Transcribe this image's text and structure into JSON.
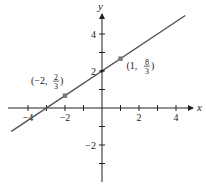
{
  "figure": {
    "type": "line-graph",
    "colors": {
      "axis": "#222222",
      "line": "#555555",
      "point": "#777777"
    },
    "axes": {
      "x_label": "x",
      "y_label": "y",
      "x_range": [
        -5,
        5
      ],
      "y_range": [
        -4,
        5.5
      ],
      "x_ticks": [
        -4,
        -3,
        -2,
        -1,
        1,
        2,
        3,
        4
      ],
      "y_ticks": [
        -3,
        -2,
        -1,
        1,
        2,
        3,
        4
      ],
      "x_tick_labels": [
        {
          "value": -4,
          "text": "−4"
        },
        {
          "value": -2,
          "text": "−2"
        },
        {
          "value": 2,
          "text": "2"
        },
        {
          "value": 4,
          "text": "4"
        }
      ],
      "y_tick_labels": [
        {
          "value": 4,
          "text": "4"
        },
        {
          "value": 2,
          "text": "2"
        },
        {
          "value": -2,
          "text": "−2"
        }
      ]
    },
    "line": {
      "equation": "y = (2/3)x + 2",
      "slope": "2/3",
      "y_intercept": 2,
      "x_intercept": -3
    },
    "points": [
      {
        "x": -2,
        "y": 0.6667,
        "label_prefix": "(−2, ",
        "label_num": "2",
        "label_den": "3",
        "label_suffix": ")"
      },
      {
        "x": 1,
        "y": 2.6667,
        "label_prefix": "(1, ",
        "label_num": "8",
        "label_den": "3",
        "label_suffix": ")"
      }
    ]
  }
}
